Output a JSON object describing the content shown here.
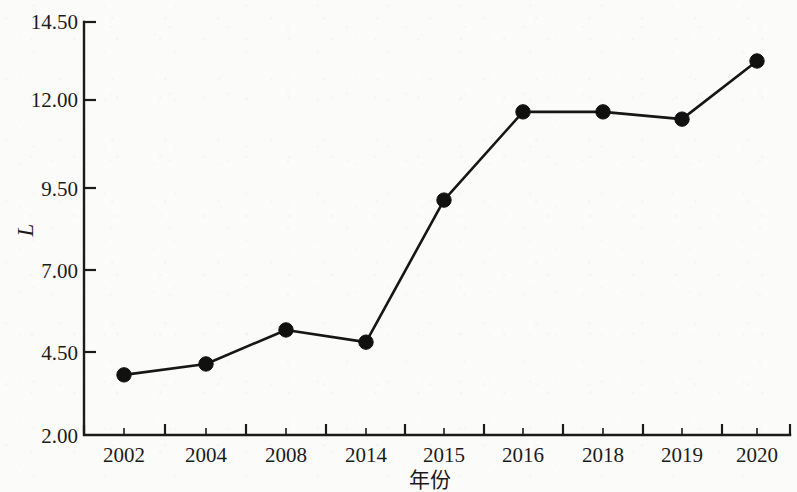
{
  "chart_data": {
    "type": "line",
    "title": "",
    "subtitle": "",
    "xlabel": "年份",
    "ylabel": "L",
    "categories": [
      "2002",
      "2004",
      "2008",
      "2014",
      "2015",
      "2016",
      "2018",
      "2019",
      "2020"
    ],
    "values": [
      3.82,
      4.15,
      5.18,
      4.81,
      9.11,
      11.78,
      11.78,
      11.56,
      13.32
    ],
    "series": [
      {
        "name": "L",
        "values": [
          3.82,
          4.15,
          5.18,
          4.81,
          9.11,
          11.78,
          11.78,
          11.56,
          13.32
        ]
      }
    ],
    "ylim": [
      2.0,
      14.5
    ],
    "yticks": [
      2.0,
      4.5,
      7.0,
      9.5,
      12.0,
      14.5
    ],
    "ytick_labels": [
      "2.00",
      "4.50",
      "7.00",
      "9.50",
      "12.00",
      "14.50"
    ],
    "xtick_labels": [
      "2002",
      "2004",
      "2008",
      "2014",
      "2015",
      "2016",
      "2018",
      "2019",
      "2020"
    ],
    "grid": false,
    "legend": false,
    "legend_position": "none",
    "marker": "filled-circle",
    "line_color": "#161616",
    "marker_color": "#111111",
    "axis_color": "#1b1b1b",
    "background_color": "#fbfbfa",
    "minor_ticks_between_majors": 1
  },
  "axes": {
    "y_axis_title": "L",
    "x_axis_title": "年份"
  }
}
